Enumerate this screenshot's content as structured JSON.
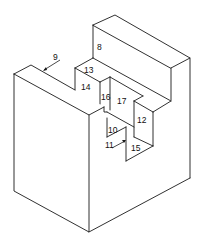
{
  "diagram": {
    "type": "isometric-part-drawing",
    "line_color": "#1a1a1a",
    "background": "#ffffff",
    "labels": {
      "l8": "8",
      "l9": "9",
      "l10": "10",
      "l11": "11",
      "l12": "12",
      "l13": "13",
      "l14": "14",
      "l15": "15",
      "l16": "16",
      "l17": "17"
    },
    "face_numbers": [
      "8",
      "9",
      "10",
      "11",
      "12",
      "13",
      "14",
      "15",
      "16",
      "17"
    ]
  }
}
